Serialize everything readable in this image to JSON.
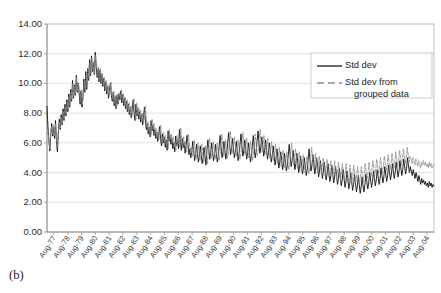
{
  "figure": {
    "caption": "(b)"
  },
  "chart_data": {
    "type": "line",
    "title": "",
    "xlabel": "",
    "ylabel": "",
    "ylim": [
      0,
      14
    ],
    "ytick_step": 2,
    "ytick_labels": [
      "0.00",
      "2.00",
      "4.00",
      "6.00",
      "8.00",
      "10.00",
      "12.00",
      "14.00"
    ],
    "ytick_values": [
      0,
      2,
      4,
      6,
      8,
      10,
      12,
      14
    ],
    "grid": true,
    "grid_axis": "y",
    "legend_position": "top-right",
    "x_tick_labels": [
      "Aug-77",
      "Aug-78",
      "Aug-79",
      "Aug-80",
      "Aug-81",
      "Aug-82",
      "Aug-83",
      "Aug-84",
      "Aug-85",
      "Aug-86",
      "Aug-87",
      "Aug-88",
      "Aug-89",
      "Aug-90",
      "Aug-91",
      "Aug-92",
      "Aug-93",
      "Aug-94",
      "Aug-95",
      "Aug-96",
      "Aug-97",
      "Aug-98",
      "Aug-99",
      "Aug-00",
      "Aug-01",
      "Aug-02",
      "Aug-03",
      "Aug-04"
    ],
    "x_range_start": "Aug-77",
    "x_range_end": "Aug-04",
    "series": [
      {
        "name": "Std dev",
        "style": "solid",
        "color": "#1a1a1a",
        "values": [
          8.45,
          7.1,
          6.2,
          5.45,
          6.6,
          7.3,
          6.45,
          7.05,
          6.3,
          7.5,
          6.05,
          5.4,
          6.7,
          7.6,
          6.9,
          7.9,
          7.2,
          8.3,
          7.5,
          8.6,
          7.8,
          8.9,
          8.1,
          9.3,
          8.4,
          9.6,
          8.8,
          10.2,
          9.0,
          9.9,
          9.2,
          10.55,
          9.4,
          10.05,
          9.3,
          8.6,
          9.5,
          8.4,
          9.1,
          10.3,
          9.4,
          10.8,
          9.6,
          11.0,
          10.2,
          11.6,
          10.5,
          11.85,
          10.8,
          11.4,
          10.6,
          12.1,
          11.1,
          10.4,
          11.0,
          10.1,
          10.9,
          10.0,
          10.6,
          9.8,
          10.35,
          9.5,
          10.1,
          9.3,
          9.8,
          9.0,
          9.55,
          10.0,
          9.2,
          8.8,
          9.4,
          8.5,
          9.1,
          8.3,
          9.2,
          8.6,
          9.3,
          8.9,
          9.5,
          8.7,
          9.25,
          8.5,
          9.0,
          8.3,
          8.8,
          8.1,
          8.6,
          7.9,
          8.4,
          7.7,
          8.2,
          8.9,
          8.0,
          7.5,
          8.6,
          7.8,
          8.3,
          7.6,
          8.1,
          7.4,
          7.9,
          7.2,
          7.7,
          8.4,
          7.5,
          6.9,
          7.3,
          6.6,
          7.05,
          6.4,
          7.5,
          6.8,
          7.2,
          6.5,
          6.9,
          6.3,
          6.7,
          6.1,
          6.5,
          7.1,
          6.3,
          5.8,
          6.6,
          6.0,
          6.4,
          5.7,
          6.2,
          5.5,
          6.8,
          6.1,
          6.5,
          5.9,
          6.3,
          5.6,
          6.0,
          5.4,
          6.45,
          5.8,
          6.2,
          5.6,
          6.9,
          6.1,
          5.5,
          6.3,
          5.7,
          6.0,
          5.3,
          5.8,
          6.5,
          5.9,
          5.2,
          5.6,
          5.0,
          5.4,
          6.1,
          5.5,
          4.8,
          5.2,
          5.9,
          5.3,
          4.7,
          5.1,
          5.8,
          5.2,
          4.6,
          5.0,
          5.7,
          5.1,
          4.5,
          5.5,
          6.2,
          5.6,
          4.9,
          5.3,
          6.0,
          5.4,
          4.8,
          5.2,
          5.9,
          5.3,
          4.7,
          5.1,
          5.8,
          6.5,
          5.7,
          5.0,
          5.4,
          6.1,
          5.5,
          4.9,
          5.3,
          6.0,
          6.7,
          5.9,
          5.2,
          5.6,
          6.3,
          5.7,
          5.0,
          5.4,
          6.1,
          5.5,
          4.8,
          5.2,
          5.9,
          6.6,
          5.8,
          5.1,
          5.5,
          6.2,
          5.6,
          4.9,
          5.3,
          6.0,
          5.4,
          4.7,
          5.1,
          5.8,
          6.5,
          5.7,
          5.0,
          5.4,
          6.1,
          6.8,
          6.0,
          5.3,
          5.7,
          6.4,
          5.8,
          5.1,
          5.5,
          6.2,
          5.6,
          4.9,
          5.3,
          6.0,
          5.4,
          4.7,
          5.1,
          5.8,
          5.2,
          4.5,
          4.9,
          5.6,
          5.0,
          4.3,
          4.7,
          5.4,
          4.8,
          4.2,
          4.6,
          5.3,
          4.7,
          4.1,
          4.5,
          5.2,
          5.9,
          5.1,
          4.4,
          4.8,
          5.5,
          4.9,
          4.2,
          4.6,
          5.3,
          4.7,
          4.0,
          4.4,
          5.1,
          4.5,
          3.9,
          4.3,
          5.0,
          4.4,
          3.8,
          4.2,
          4.9,
          5.6,
          4.8,
          4.1,
          4.5,
          5.2,
          4.6,
          3.9,
          4.3,
          5.0,
          4.4,
          3.7,
          4.1,
          4.8,
          4.2,
          3.6,
          4.0,
          4.7,
          4.1,
          3.5,
          3.9,
          4.6,
          4.0,
          3.4,
          3.8,
          4.5,
          3.9,
          3.3,
          3.7,
          4.4,
          3.8,
          3.2,
          3.6,
          4.3,
          3.7,
          3.1,
          3.5,
          4.2,
          3.6,
          3.0,
          3.4,
          4.1,
          3.5,
          2.9,
          3.3,
          4.0,
          3.4,
          2.8,
          3.2,
          3.9,
          3.3,
          2.7,
          3.1,
          3.8,
          3.2,
          2.6,
          3.0,
          3.7,
          3.1,
          2.7,
          3.2,
          3.9,
          3.4,
          2.9,
          3.3,
          4.0,
          3.5,
          3.0,
          3.4,
          4.1,
          3.6,
          3.1,
          3.5,
          4.2,
          3.7,
          3.2,
          3.6,
          4.3,
          3.8,
          3.3,
          3.7,
          4.4,
          3.9,
          3.4,
          3.8,
          4.5,
          4.0,
          3.5,
          3.9,
          4.6,
          4.1,
          3.6,
          4.0,
          4.7,
          4.2,
          3.7,
          4.1,
          4.8,
          4.3,
          3.8,
          4.2,
          4.9,
          4.4,
          3.9,
          4.3,
          5.0,
          4.5,
          4.0,
          4.4,
          4.1,
          3.8,
          4.2,
          3.9,
          3.6,
          4.0,
          3.7,
          3.4,
          3.8,
          3.5,
          3.2,
          3.6,
          3.3,
          3.5,
          3.2,
          3.4,
          3.1,
          3.3,
          3.0,
          3.4,
          3.1,
          3.3,
          3.0,
          3.2,
          3.1
        ],
        "start_value": 8.45,
        "peak_value": 12.1,
        "min_value": 2.6,
        "end_value": 3.1
      },
      {
        "name": "Std dev from grouped data",
        "style": "dashed",
        "color": "#8c8c8c",
        "values": [
          6.6,
          6.9,
          6.0,
          5.6,
          6.8,
          7.1,
          6.6,
          7.2,
          6.5,
          7.3,
          6.2,
          5.7,
          6.9,
          7.4,
          7.0,
          7.7,
          7.3,
          8.1,
          7.6,
          8.4,
          7.9,
          8.7,
          8.2,
          9.1,
          8.5,
          9.4,
          8.9,
          10.0,
          9.1,
          9.8,
          9.3,
          10.4,
          9.5,
          10.0,
          9.4,
          8.8,
          9.6,
          8.6,
          9.2,
          10.1,
          9.5,
          10.6,
          9.7,
          10.9,
          10.3,
          11.4,
          10.6,
          11.7,
          10.9,
          11.5,
          10.7,
          11.9,
          11.2,
          10.5,
          11.1,
          10.2,
          11.0,
          10.1,
          10.7,
          9.9,
          10.4,
          9.6,
          10.2,
          9.4,
          9.9,
          9.1,
          9.6,
          10.1,
          9.3,
          8.9,
          9.5,
          8.6,
          9.2,
          8.4,
          9.3,
          8.7,
          9.4,
          9.0,
          9.6,
          8.8,
          9.3,
          8.6,
          9.1,
          8.4,
          8.9,
          8.2,
          8.7,
          8.0,
          8.5,
          7.8,
          8.3,
          9.0,
          8.1,
          7.6,
          8.7,
          7.9,
          8.4,
          7.7,
          8.2,
          7.5,
          8.0,
          7.3,
          7.8,
          8.5,
          7.6,
          7.0,
          7.4,
          6.7,
          7.15,
          6.5,
          7.6,
          6.9,
          7.3,
          6.6,
          7.0,
          6.4,
          6.8,
          6.2,
          6.6,
          7.2,
          6.4,
          5.9,
          6.7,
          6.1,
          6.5,
          5.8,
          6.3,
          5.6,
          6.9,
          6.2,
          6.6,
          6.0,
          6.4,
          5.7,
          6.1,
          5.5,
          6.5,
          5.9,
          6.3,
          5.7,
          7.0,
          6.2,
          5.6,
          6.4,
          5.8,
          6.1,
          5.4,
          5.9,
          6.6,
          6.0,
          5.3,
          5.7,
          5.1,
          5.5,
          6.2,
          5.6,
          4.9,
          5.3,
          6.0,
          5.4,
          4.8,
          5.2,
          5.9,
          5.3,
          4.7,
          5.1,
          5.8,
          5.2,
          4.6,
          5.6,
          6.3,
          5.7,
          5.0,
          5.4,
          6.1,
          5.5,
          4.9,
          5.3,
          6.0,
          5.4,
          4.8,
          5.2,
          5.9,
          6.6,
          5.8,
          5.1,
          5.5,
          6.2,
          5.6,
          5.0,
          5.4,
          6.1,
          6.8,
          6.0,
          5.3,
          5.7,
          6.4,
          5.8,
          5.1,
          5.5,
          6.2,
          5.6,
          4.9,
          5.3,
          6.0,
          6.7,
          5.9,
          5.2,
          5.6,
          6.3,
          5.7,
          5.0,
          5.4,
          6.1,
          5.5,
          4.8,
          5.2,
          5.9,
          6.6,
          5.8,
          5.1,
          5.5,
          6.2,
          6.9,
          6.1,
          5.4,
          5.8,
          6.5,
          5.9,
          5.2,
          5.6,
          6.3,
          5.7,
          5.0,
          5.4,
          6.1,
          5.5,
          4.8,
          5.2,
          5.9,
          5.3,
          4.6,
          5.0,
          5.7,
          5.1,
          4.4,
          4.8,
          5.5,
          4.9,
          4.3,
          4.7,
          5.4,
          4.8,
          4.2,
          4.6,
          5.3,
          6.0,
          5.2,
          4.5,
          4.9,
          5.6,
          5.0,
          4.3,
          4.7,
          5.4,
          4.8,
          4.1,
          4.5,
          5.2,
          4.6,
          4.0,
          4.4,
          5.1,
          4.5,
          3.9,
          4.3,
          5.0,
          5.7,
          4.9,
          4.2,
          4.6,
          5.3,
          4.7,
          4.0,
          4.4,
          5.1,
          4.5,
          3.9,
          4.3,
          5.0,
          4.4,
          3.8,
          4.2,
          4.9,
          4.3,
          3.7,
          4.1,
          4.8,
          4.2,
          3.7,
          4.1,
          4.8,
          4.2,
          3.6,
          4.0,
          4.7,
          4.1,
          3.5,
          3.9,
          4.6,
          4.0,
          3.5,
          3.9,
          4.6,
          4.0,
          3.4,
          3.8,
          4.5,
          3.9,
          3.4,
          3.8,
          4.5,
          3.9,
          3.3,
          3.7,
          4.4,
          3.8,
          3.3,
          3.7,
          4.4,
          3.8,
          3.4,
          3.9,
          4.6,
          4.1,
          3.6,
          4.0,
          4.7,
          4.2,
          3.7,
          4.1,
          4.8,
          4.3,
          3.8,
          4.2,
          4.9,
          4.4,
          3.9,
          4.3,
          5.0,
          4.5,
          4.0,
          4.4,
          5.1,
          4.6,
          4.1,
          4.5,
          5.2,
          4.7,
          4.2,
          4.6,
          5.3,
          4.8,
          4.3,
          4.7,
          5.4,
          4.9,
          4.4,
          4.8,
          5.5,
          5.0,
          4.5,
          4.9,
          5.6,
          5.1,
          4.6,
          5.0,
          5.7,
          5.2,
          4.7,
          5.1,
          4.9,
          4.6,
          5.0,
          4.8,
          4.5,
          4.9,
          4.7,
          4.4,
          4.8,
          4.6,
          4.3,
          4.7,
          4.5,
          4.8,
          4.5,
          4.7,
          4.4,
          4.6,
          4.3,
          4.7,
          4.4,
          4.6,
          4.3,
          4.5,
          4.5
        ],
        "start_value": 6.6,
        "peak_value": 11.9,
        "min_value": 3.3,
        "end_value": 4.5
      }
    ]
  },
  "legend": {
    "items": [
      {
        "label": "Std dev",
        "style": "solid",
        "color": "#1a1a1a"
      },
      {
        "label": "Std dev from",
        "label2": "grouped data",
        "style": "dashed",
        "color": "#8c8c8c"
      }
    ]
  },
  "colors": {
    "series_solid": "#1a1a1a",
    "series_dashed": "#8c8c8c",
    "gridline": "#d9d9d9",
    "axis": "#9a9a9a",
    "plot_border": "#bdbdbd",
    "background": "#ffffff"
  }
}
